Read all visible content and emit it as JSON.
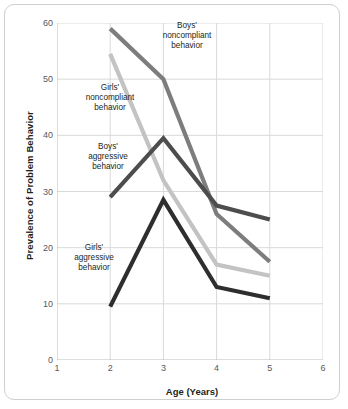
{
  "chart_data": {
    "type": "line",
    "title": "",
    "xlabel": "Age (Years)",
    "ylabel": "Prevalence of Problem Behavior",
    "x": [
      2,
      3,
      4,
      5
    ],
    "xlim": [
      1,
      6
    ],
    "ylim": [
      0,
      60
    ],
    "xticks": [
      1,
      2,
      3,
      4,
      5,
      6
    ],
    "yticks": [
      0,
      10,
      20,
      30,
      40,
      50,
      60
    ],
    "grid": true,
    "legend": "none",
    "series": [
      {
        "name": "Boys' noncompliant behavior",
        "color": "#7d7d7d",
        "values": [
          59,
          50,
          26,
          17.5
        ]
      },
      {
        "name": "Girls' noncompliant behavior",
        "color": "#c3c3c3",
        "values": [
          54.5,
          32,
          17,
          15
        ]
      },
      {
        "name": "Boys' aggressive behavior",
        "color": "#4d4d4d",
        "values": [
          29,
          39.5,
          27.5,
          25
        ]
      },
      {
        "name": "Girls' aggressive behavior",
        "color": "#2e2e2e",
        "values": [
          9.5,
          28.5,
          13,
          11
        ]
      }
    ],
    "annotations": [
      {
        "text": "Boys'\nnoncompliant\nbehavior",
        "x_px": 134,
        "y_px": 16,
        "width": 96
      },
      {
        "text": "Girls'\nnoncompliant\nbehavior",
        "x_px": 57,
        "y_px": 78,
        "width": 96
      },
      {
        "text": "Boys'\naggressive\nbehavior",
        "x_px": 58,
        "y_px": 137,
        "width": 90
      },
      {
        "text": "Girls'\naggressive\nbehavior",
        "x_px": 44,
        "y_px": 238,
        "width": 90
      }
    ]
  },
  "style": {
    "grid_color": "#d9d9d9",
    "axis_color": "#bcbcbc",
    "tick_text_color": "#58595b",
    "frame_color": "#cfcfcf",
    "background": "#ffffff"
  }
}
